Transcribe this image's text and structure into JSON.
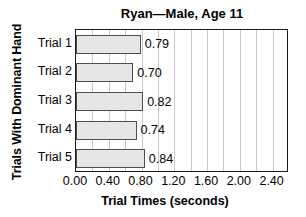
{
  "chart_data": {
    "type": "bar",
    "orientation": "horizontal",
    "title": "Ryan—Male, Age 11",
    "xlabel": "Trial Times (seconds)",
    "ylabel": "Trials With Dominant Hand",
    "categories": [
      "Trial 1",
      "Trial 2",
      "Trial 3",
      "Trial 4",
      "Trial 5"
    ],
    "values": [
      0.79,
      0.7,
      0.82,
      0.74,
      0.84
    ],
    "value_labels": [
      "0.79",
      "0.70",
      "0.82",
      "0.74",
      "0.84"
    ],
    "xlim": [
      0.0,
      2.6
    ],
    "xticks": [
      0.0,
      0.4,
      0.8,
      1.2,
      1.6,
      2.0,
      2.4
    ],
    "xtick_labels": [
      "0.00",
      "0.40",
      "0.80",
      "1.20",
      "1.60",
      "2.00",
      "2.40"
    ],
    "minor_gridline_step": 0.2,
    "grid": true,
    "grid_axis": "x",
    "legend": false,
    "colors": {
      "bar_fill": "#e6e6e6",
      "bar_edge": "#4d4d4d",
      "gridline": "#c9c9c9",
      "frame": "#1a1a1a",
      "text": "#000000",
      "background": "#ffffff"
    }
  }
}
